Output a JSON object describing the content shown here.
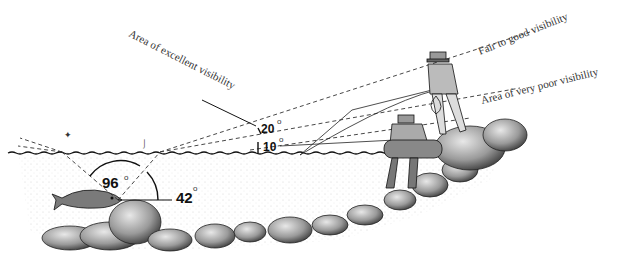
{
  "diagram": {
    "labels": {
      "excellent": "Area of excellent visibility",
      "fair_to_good": "Fair to good visibility",
      "very_poor": "Area of very poor visibility"
    },
    "angles": {
      "cone": "96",
      "elevation": "42",
      "upper": "20",
      "lower": "10",
      "degree_symbol": "o"
    },
    "colors": {
      "ink": "#111111",
      "dash": "#333333",
      "shade": "#bdbdbd",
      "rock": "#8a8a8a",
      "water_speckle": "#cfcfcf"
    }
  }
}
